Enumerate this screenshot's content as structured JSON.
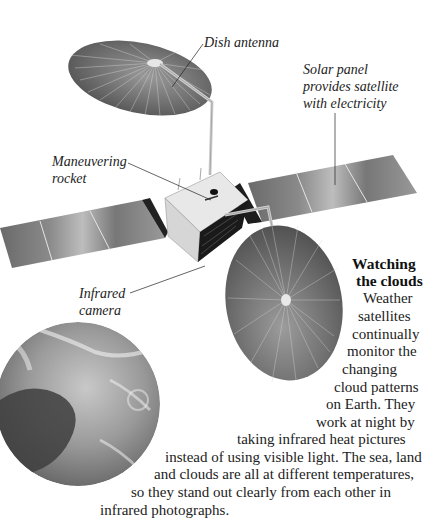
{
  "labels": {
    "dish_antenna": "Dish antenna",
    "solar_panel": [
      "Solar panel",
      "provides satellite",
      "with electricity"
    ],
    "maneuvering_rocket": [
      "Maneuvering",
      "rocket"
    ],
    "infrared_camera": [
      "Infrared",
      "camera"
    ]
  },
  "article": {
    "heading": [
      "Watching",
      "the clouds"
    ],
    "lines": [
      "Weather",
      "satellites",
      "continually",
      "monitor the",
      "changing",
      "cloud patterns",
      "on Earth. They",
      "work at night by",
      "taking infrared heat pictures",
      "instead of using visible light. The sea, land",
      "and clouds are all at different temperatures,",
      "so they stand out clearly from each other in",
      "infrared photographs."
    ]
  },
  "illustrations": {
    "satellite": "weather-satellite-illustration",
    "earth": "earth-infrared-photo"
  }
}
